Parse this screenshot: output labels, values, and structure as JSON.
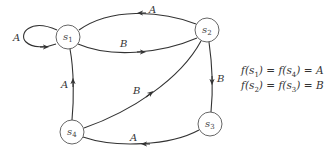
{
  "diagram": {
    "type": "state-transition-graph",
    "nodes": [
      {
        "id": "s1",
        "base": "s",
        "sub": "1"
      },
      {
        "id": "s2",
        "base": "s",
        "sub": "2"
      },
      {
        "id": "s3",
        "base": "s",
        "sub": "3"
      },
      {
        "id": "s4",
        "base": "s",
        "sub": "4"
      }
    ],
    "edges": [
      {
        "from": "s1",
        "to": "s1",
        "label": "A"
      },
      {
        "from": "s2",
        "to": "s1",
        "label": "A"
      },
      {
        "from": "s1",
        "to": "s2",
        "label": "B"
      },
      {
        "from": "s2",
        "to": "s3",
        "label": "B"
      },
      {
        "from": "s3",
        "to": "s4",
        "label": "A"
      },
      {
        "from": "s4",
        "to": "s1",
        "label": "A"
      },
      {
        "from": "s4",
        "to": "s2",
        "label": "B"
      }
    ]
  },
  "equations": [
    {
      "f": "f",
      "a": "s",
      "a_sub": "1",
      "b": "s",
      "b_sub": "4",
      "value": "A"
    },
    {
      "f": "f",
      "a": "s",
      "a_sub": "2",
      "b": "s",
      "b_sub": "3",
      "value": "B"
    }
  ],
  "strings": {
    "eq_open": "(",
    "eq_close": ")",
    "eq_sign": " = "
  }
}
